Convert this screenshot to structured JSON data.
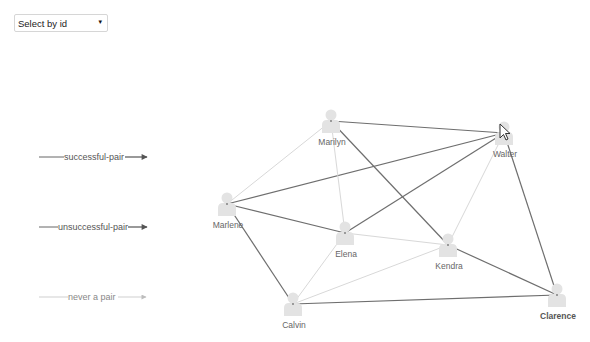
{
  "select": {
    "value": "Select by id",
    "arrow": "▾"
  },
  "legend": {
    "items": [
      {
        "label": "successful-pair",
        "type": "successful",
        "color": "#6e6e6e"
      },
      {
        "label": "unsuccessful-pair",
        "type": "unsuccessful",
        "color": "#6e6e6e"
      },
      {
        "label": "never a pair",
        "type": "never",
        "color": "#bdbdbd"
      }
    ]
  },
  "graph": {
    "nodes": [
      {
        "id": "Marilyn",
        "label": "Marilyn",
        "x": 331,
        "y": 121,
        "bold": false
      },
      {
        "id": "Walter",
        "label": "Walter",
        "x": 504,
        "y": 133,
        "bold": false
      },
      {
        "id": "Marlene",
        "label": "Marlene",
        "x": 227,
        "y": 204,
        "bold": false
      },
      {
        "id": "Elena",
        "label": "Elena",
        "x": 345,
        "y": 233,
        "bold": false
      },
      {
        "id": "Kendra",
        "label": "Kendra",
        "x": 448,
        "y": 245,
        "bold": false
      },
      {
        "id": "Calvin",
        "label": "Calvin",
        "x": 293,
        "y": 304,
        "bold": false
      },
      {
        "id": "Clarence",
        "label": "Clarence",
        "x": 557,
        "y": 295,
        "bold": true
      }
    ],
    "edges": [
      {
        "source": "Marilyn",
        "target": "Walter",
        "type": "successful"
      },
      {
        "source": "Marilyn",
        "target": "Kendra",
        "type": "successful"
      },
      {
        "source": "Marlene",
        "target": "Walter",
        "type": "successful"
      },
      {
        "source": "Marlene",
        "target": "Elena",
        "type": "successful"
      },
      {
        "source": "Marlene",
        "target": "Calvin",
        "type": "successful"
      },
      {
        "source": "Elena",
        "target": "Walter",
        "type": "successful"
      },
      {
        "source": "Kendra",
        "target": "Clarence",
        "type": "successful"
      },
      {
        "source": "Walter",
        "target": "Clarence",
        "type": "successful"
      },
      {
        "source": "Calvin",
        "target": "Clarence",
        "type": "successful"
      },
      {
        "source": "Marilyn",
        "target": "Marlene",
        "type": "never"
      },
      {
        "source": "Marilyn",
        "target": "Elena",
        "type": "never"
      },
      {
        "source": "Elena",
        "target": "Kendra",
        "type": "never"
      },
      {
        "source": "Elena",
        "target": "Calvin",
        "type": "never"
      },
      {
        "source": "Kendra",
        "target": "Walter",
        "type": "never"
      },
      {
        "source": "Calvin",
        "target": "Kendra",
        "type": "never"
      }
    ]
  },
  "cursor": {
    "x": 500,
    "y": 124
  }
}
